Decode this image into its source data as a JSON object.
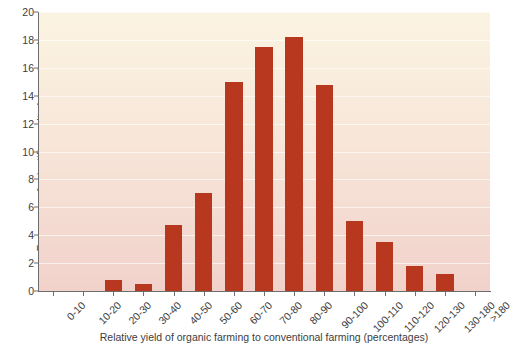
{
  "chart_data": {
    "type": "bar",
    "title": "",
    "xlabel": "Relative yield of organic farming to conventional farming (percentages)",
    "ylabel": "Frequency of scientific results (percentages)",
    "categories": [
      "0-10",
      "10-20",
      "20-30",
      "30-40",
      "40-50",
      "50-60",
      "60-70",
      "70-80",
      "80-90",
      "90-100",
      "100-110",
      "110-120",
      "120-130",
      "130-180",
      ">180"
    ],
    "values": [
      0,
      0,
      0.8,
      0.5,
      4.7,
      7.0,
      15.0,
      17.5,
      18.2,
      14.8,
      5.0,
      3.5,
      1.8,
      1.2,
      0
    ],
    "ylim": [
      0,
      20
    ],
    "ytick_values": [
      0,
      2,
      4,
      6,
      8,
      10,
      12,
      14,
      16,
      18,
      20
    ],
    "ytick_labels": [
      "0",
      "2",
      "4",
      "6",
      "8",
      "10",
      "12",
      "14",
      "16",
      "18",
      "20"
    ],
    "grid": true,
    "legend": "none",
    "bar_color": "#b8381f",
    "plot_background_top": "#fbf3e2",
    "plot_background_bottom": "#f1d2cb",
    "axis_color": "#6d6d6d"
  }
}
